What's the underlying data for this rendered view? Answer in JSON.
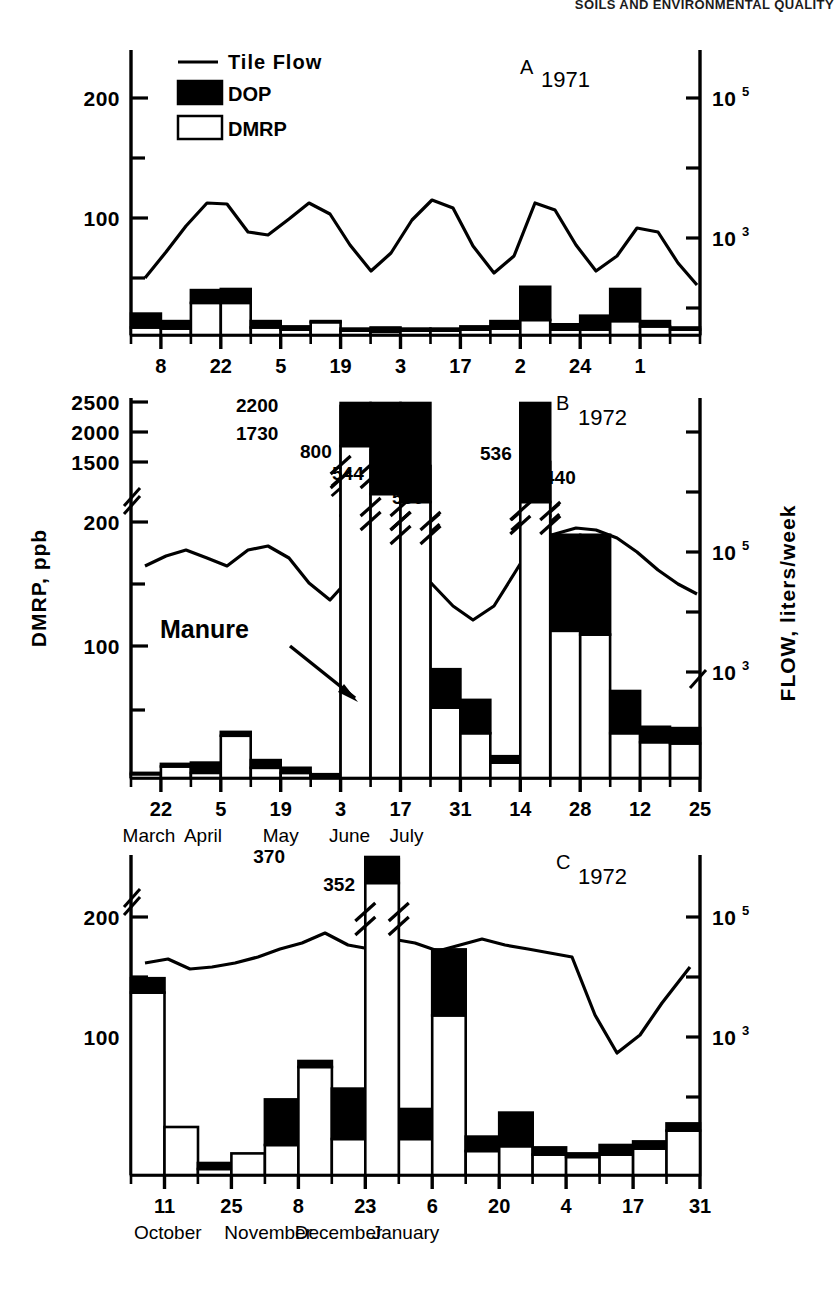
{
  "running_head": "SOILS AND ENVIRONMENTAL QUALITY",
  "legend": {
    "items": [
      {
        "key": "line",
        "label": "Tile Flow",
        "icon": "line-swatch"
      },
      {
        "key": "dop",
        "label": "DOP",
        "icon": "filled-square-swatch"
      },
      {
        "key": "dmrp",
        "label": "DMRP",
        "icon": "open-square-swatch"
      }
    ]
  },
  "axis_titles": {
    "left": "DMRP, ppb",
    "right": "FLOW, liters/week"
  },
  "colors": {
    "dop": "#000000",
    "dmrp": "#ffffff",
    "line": "#000000",
    "axis": "#000000"
  },
  "chart_data": [
    {
      "id": "A",
      "type": "bar",
      "title": "A",
      "subtitle": "1971",
      "panel_letter": "A",
      "year": "1971",
      "xlabel": "",
      "ylabel": "DMRP, ppb",
      "ylabel_right": "FLOW, liters/week",
      "ylim": [
        0,
        240
      ],
      "yticks": [
        100,
        200
      ],
      "yticklabels": [
        "100",
        "200"
      ],
      "yminorticks": [
        50,
        150,
        230
      ],
      "right_yticks": [
        {
          "value": 215,
          "label": "10",
          "exp": "5"
        },
        {
          "value": 100,
          "label": "10",
          "exp": "3"
        }
      ],
      "right_yminorticks": [
        158,
        45
      ],
      "grid": false,
      "legend_position": "top-left",
      "x_tick_labels": [
        "8",
        "22",
        "5",
        "19",
        "3",
        "17",
        "2",
        "24",
        "1"
      ],
      "x_tick_index": [
        1,
        3,
        5,
        7,
        9,
        11,
        13,
        15,
        17
      ],
      "months": [
        {
          "label": "March",
          "index": 2
        },
        {
          "label": "April",
          "index": 6
        },
        {
          "label": "May",
          "index": 10
        },
        {
          "label": "June",
          "index": 14
        },
        {
          "label": "July",
          "index": 17.6
        }
      ],
      "n_bars": 19,
      "series": [
        {
          "name": "DMRP",
          "values": [
            7,
            6,
            30,
            30,
            7,
            5,
            12,
            4,
            3,
            4,
            4,
            5,
            6,
            14,
            5,
            5,
            13,
            8,
            5
          ]
        },
        {
          "name": "DOP",
          "values": [
            13,
            7,
            12,
            13,
            6,
            3,
            1,
            2,
            4,
            2,
            2,
            3,
            7,
            31,
            5,
            13,
            30,
            5,
            2
          ]
        }
      ],
      "flow_line": [
        48,
        75,
        105,
        128,
        125,
        100,
        97,
        112,
        128,
        118,
        88,
        62,
        78,
        112,
        130,
        122,
        75,
        48,
        70,
        128,
        122,
        80,
        52,
        70,
        103,
        97,
        60,
        40
      ]
    },
    {
      "id": "B",
      "type": "bar",
      "title": "B",
      "subtitle": "1972",
      "panel_letter": "B",
      "year": "1972",
      "xlabel": "",
      "ylabel": "DMRP, ppb",
      "ylabel_right": "FLOW, liters/week",
      "ylim": [
        0,
        260
      ],
      "yticks": [
        100,
        200,
        1500,
        2000,
        2500
      ],
      "yticklabels": [
        "100",
        "200",
        "1500",
        "2000",
        "2500"
      ],
      "axis_break_at": 210,
      "grid": false,
      "x_tick_labels": [
        "22",
        "5",
        "19",
        "3",
        "17",
        "31",
        "14",
        "28",
        "12",
        "25"
      ],
      "months": [
        {
          "label": "March",
          "index": 0.6
        },
        {
          "label": "April",
          "index": 2.4
        },
        {
          "label": "May",
          "index": 5.0
        },
        {
          "label": "June",
          "index": 7.3
        },
        {
          "label": "July",
          "index": 9.2
        }
      ],
      "n_bars": 19,
      "series": [
        {
          "name": "DMRP",
          "values": [
            3,
            9,
            4,
            33,
            8,
            4,
            2,
            1730,
            300,
            500,
            55,
            35,
            12,
            440,
            115,
            112,
            35,
            28,
            27
          ]
        },
        {
          "name": "DOP",
          "values": [
            1,
            2,
            8,
            3,
            6,
            4,
            1,
            470,
            500,
            44,
            30,
            26,
            5,
            96,
            75,
            78,
            33,
            12,
            12
          ]
        }
      ],
      "annotations": [
        {
          "text": "2200",
          "bar": 7,
          "kind": "total"
        },
        {
          "text": "1730",
          "bar": 7,
          "kind": "dmrp"
        },
        {
          "text": "800",
          "bar": 8,
          "kind": "total"
        },
        {
          "text": "300",
          "bar": 8,
          "kind": "dmrp"
        },
        {
          "text": "544",
          "bar": 9,
          "kind": "total"
        },
        {
          "text": "500",
          "bar": 9,
          "kind": "dmrp"
        },
        {
          "text": "536",
          "bar": 13,
          "kind": "total"
        },
        {
          "text": "440",
          "bar": 13,
          "kind": "dmrp"
        }
      ],
      "event_annotation": {
        "text": "Manure",
        "arrow": "down-right"
      },
      "right_yticks": [
        {
          "value": 170,
          "label": "10",
          "exp": "5"
        },
        {
          "value": 96,
          "label": "10",
          "exp": "3"
        }
      ],
      "flow_line": [
        140,
        152,
        160,
        150,
        140,
        160,
        165,
        148,
        120,
        104,
        125,
        148,
        152,
        140,
        125,
        108,
        97,
        104,
        130,
        168,
        175,
        180,
        178,
        170,
        158,
        142,
        130,
        122
      ]
    },
    {
      "id": "C",
      "type": "bar",
      "title": "C",
      "subtitle": "1972",
      "panel_letter": "C",
      "year": "1972",
      "xlabel": "",
      "ylabel": "DMRP, ppb",
      "ylabel_right": "FLOW, liters/week",
      "ylim": [
        0,
        255
      ],
      "yticks": [
        100,
        200
      ],
      "yticklabels": [
        "100",
        "200"
      ],
      "axis_break_at": 215,
      "grid": false,
      "x_tick_labels": [
        "11",
        "25",
        "8",
        "23",
        "6",
        "20",
        "4",
        "17",
        "31"
      ],
      "months": [
        {
          "label": "October",
          "index": 1.1
        },
        {
          "label": "November",
          "index": 4.1
        },
        {
          "label": "December",
          "index": 6.2
        },
        {
          "label": "January",
          "index": 8.2
        }
      ],
      "n_bars": 17,
      "series": [
        {
          "name": "DMRP",
          "values": [
            152,
            40,
            5,
            18,
            25,
            90,
            30,
            352,
            30,
            133,
            20,
            24,
            17,
            15,
            17,
            22,
            37
          ]
        },
        {
          "name": "DOP",
          "values": [
            12,
            0,
            5,
            0,
            38,
            5,
            42,
            18,
            25,
            55,
            12,
            28,
            6,
            3,
            8,
            6,
            6
          ]
        }
      ],
      "annotations": [
        {
          "text": "370",
          "bar": 7,
          "kind": "total"
        },
        {
          "text": "352",
          "bar": 7,
          "kind": "dmrp"
        }
      ],
      "right_yticks": [
        {
          "value": 200,
          "label": "10",
          "exp": "5"
        },
        {
          "value": 100,
          "label": "10",
          "exp": "3"
        }
      ],
      "flow_line": [
        168,
        172,
        163,
        165,
        170,
        176,
        182,
        188,
        196,
        186,
        182,
        190,
        188,
        182,
        186,
        190,
        186,
        183,
        180,
        178,
        130,
        100,
        112,
        140,
        165
      ]
    }
  ]
}
